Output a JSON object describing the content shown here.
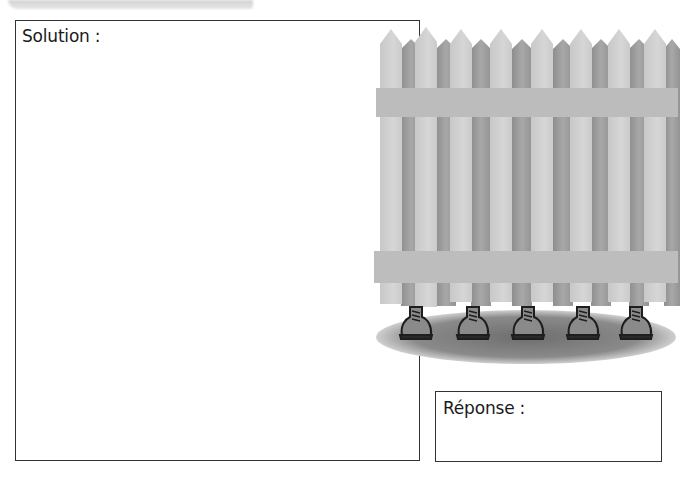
{
  "solution_box": {
    "label": "Solution :"
  },
  "answer_box": {
    "label": "Réponse :"
  },
  "illustration": {
    "subject": "picket-fence-with-feet",
    "shoe_count": 5,
    "colors": {
      "picket_light": "#cfcfcf",
      "picket_dark": "#9c9c9c",
      "rail": "#bdbdbd",
      "shadow": "#7a7a7a",
      "shoe": "#8a8a8a",
      "outline": "#1e1e1e"
    }
  }
}
